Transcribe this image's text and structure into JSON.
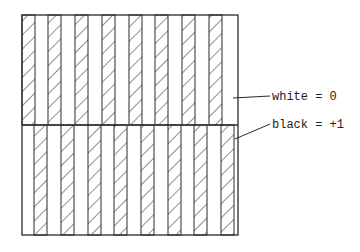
{
  "diagram": {
    "box": {
      "x": 22,
      "y": 15,
      "width": 216,
      "height": 220,
      "divider_y": 125
    },
    "stripe_width": 13,
    "top_half": {
      "description": "hatched stripes aligned to left edge",
      "hatched_stripe_x": [
        22,
        48,
        75,
        102,
        129,
        155,
        182,
        209
      ]
    },
    "bottom_half": {
      "description": "hatched stripes shifted half a period",
      "hatched_stripe_x": [
        34,
        61,
        88,
        114,
        141,
        168,
        194,
        221
      ]
    },
    "colors": {
      "line": "#2a2a2a",
      "hatch": "#333333",
      "background": "#ffffff"
    }
  },
  "legend": {
    "white_label": "white = 0",
    "black_label": "black = +1"
  }
}
